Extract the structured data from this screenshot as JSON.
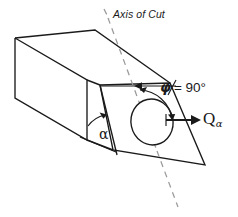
{
  "figure": {
    "domain": "diagram",
    "background_color": "#ffffff",
    "line_color": "#1a1a1a",
    "axis_color": "#9a9a9a",
    "labels": {
      "axis_of_cut": "Axis of Cut",
      "phi_symbol": "φ",
      "phi_value": "= 90°",
      "quantity_symbol": "Q",
      "quantity_subscript": "α",
      "alpha_symbol": "α"
    },
    "geometry": {
      "prism": {
        "description": "rectangular prism with an oblique cut face",
        "left_face": "15,38 15,98 87,140 87,80",
        "top_face": "15,38 100,85 170,83 95,30",
        "cut_face": "100,85 170,83 205,165 113,150"
      },
      "hole": {
        "shape": "ellipse",
        "cx": 152,
        "cy": 122,
        "rx": 21,
        "ry": 23,
        "rotation_deg": -12
      },
      "axis_of_cut": {
        "style": "dashed",
        "from": [
          108,
          18
        ],
        "to": [
          178,
          207
        ]
      },
      "angle_phi": {
        "value_deg": 90,
        "description": "arc from surface normal reference line to the Q vector"
      },
      "angle_alpha": {
        "description": "arc between the bottom edge and the cut face edge"
      },
      "vector_q": {
        "from": [
          166,
          120
        ],
        "to": [
          200,
          120
        ],
        "direction": "right"
      }
    }
  }
}
